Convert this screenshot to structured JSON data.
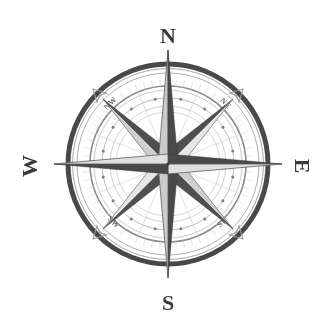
{
  "figure": {
    "name": "compass-rose",
    "background_color": "#ffffff",
    "width": 331,
    "height": 328
  },
  "geometry": {
    "center_x": 168,
    "center_y": 164,
    "outer_ring_radius": 100,
    "inner_ring_radius": 78,
    "dotted_ring_radius": 66,
    "hub_radius": 52,
    "cardinal_point_length": 140,
    "ordinal_point_length": 92
  },
  "colors": {
    "ink_dark": "#4a4a4a",
    "ink_mid": "#7d7d7d",
    "ink_light": "#b4b4b4",
    "ink_faint": "#d2d2d2",
    "paper": "#ffffff",
    "label_dark": "#3b3b3b",
    "label_mid": "#6e6e6e"
  },
  "labels": {
    "cardinal": [
      {
        "id": "north",
        "text": "N",
        "angle_deg": 0,
        "x": 168,
        "y": 38,
        "rotation": 0,
        "font_size": 22
      },
      {
        "id": "east",
        "text": "E",
        "angle_deg": 90,
        "x": 300,
        "y": 166,
        "rotation": 90,
        "font_size": 22
      },
      {
        "id": "south",
        "text": "S",
        "angle_deg": 180,
        "x": 168,
        "y": 305,
        "rotation": 0,
        "font_size": 22
      },
      {
        "id": "west",
        "text": "W",
        "angle_deg": 270,
        "x": 32,
        "y": 166,
        "rotation": -90,
        "font_size": 22
      }
    ],
    "ordinal": [
      {
        "id": "northwest",
        "text": "NW",
        "angle_deg": 315,
        "x": 112,
        "y": 105,
        "rotation": -45,
        "font_size": 8
      },
      {
        "id": "northeast",
        "text": "NE",
        "angle_deg": 45,
        "x": 224,
        "y": 105,
        "rotation": 45,
        "font_size": 8
      },
      {
        "id": "southeast",
        "text": "SE",
        "angle_deg": 135,
        "x": 224,
        "y": 224,
        "rotation": -45,
        "font_size": 8
      },
      {
        "id": "southwest",
        "text": "SW",
        "angle_deg": 225,
        "x": 112,
        "y": 224,
        "rotation": 45,
        "font_size": 8
      }
    ]
  },
  "rings": [
    {
      "id": "outer-heavy-ring",
      "radius": 100,
      "stroke_width": 5,
      "color": "#4a4a4a"
    },
    {
      "id": "outer-thin-ring",
      "radius": 92,
      "stroke_width": 1,
      "color": "#9a9a9a"
    },
    {
      "id": "mid-ring",
      "radius": 78,
      "stroke_width": 1.6,
      "color": "#8a8a8a"
    },
    {
      "id": "dotted-bead-ring",
      "radius": 66,
      "stroke_width": 1,
      "color": "#b4b4b4"
    },
    {
      "id": "inner-thin-ring",
      "radius": 58,
      "stroke_width": 1,
      "color": "#c0c0c0"
    },
    {
      "id": "hub-ring",
      "radius": 52,
      "stroke_width": 1,
      "color": "#c8c8c8"
    }
  ],
  "bead_count": 16,
  "tick_count": 64,
  "star_points": {
    "cardinal_count": 4,
    "ordinal_count": 8,
    "shading": "each point bisected into a dark half and a light outlined half"
  }
}
